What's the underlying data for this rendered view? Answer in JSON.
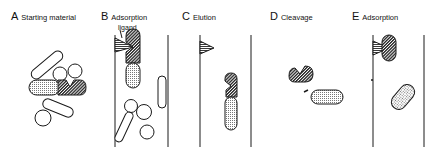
{
  "panels": [
    {
      "letter": "A",
      "title": "Starting material"
    },
    {
      "letter": "B",
      "title": "Adsorption"
    },
    {
      "letter": "C",
      "title": "Elution"
    },
    {
      "letter": "D",
      "title": "Cleavage"
    },
    {
      "letter": "E",
      "title": "Adsorption"
    }
  ],
  "annotations": {
    "ligand": "ligand"
  },
  "colors": {
    "stroke": "#1a1a1a",
    "background": "#ffffff"
  }
}
